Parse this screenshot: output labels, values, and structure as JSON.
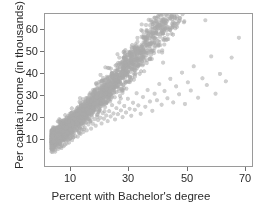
{
  "chart_data": {
    "type": "scatter",
    "title": "",
    "xlabel": "Percent with Bachelor's degree",
    "ylabel": "Per capita income (in thousands)",
    "xlim": [
      4,
      75
    ],
    "ylim": [
      6,
      67
    ],
    "xticks": [
      10,
      30,
      50,
      70
    ],
    "xticklabels": [
      "10",
      "30",
      "50",
      "70"
    ],
    "yticks": [
      10,
      20,
      30,
      40,
      50,
      60
    ],
    "yticklabels": [
      "10",
      "20",
      "30",
      "40",
      "50",
      "60"
    ],
    "grid": false,
    "legend": null,
    "marker_color": "#a9a9a9",
    "marker_size": 2.1,
    "marker_opacity": 0.55,
    "frame_color": "#9a9a9a",
    "n_points": 3100,
    "correlation": 0.73,
    "points": [
      [
        6.2,
        13.1
      ],
      [
        6.5,
        14.4
      ],
      [
        6.8,
        12.6
      ],
      [
        7.0,
        15.3
      ],
      [
        7.2,
        13.8
      ],
      [
        7.4,
        16.1
      ],
      [
        7.5,
        11.8
      ],
      [
        7.7,
        14.9
      ],
      [
        7.9,
        17.2
      ],
      [
        8.0,
        13.4
      ],
      [
        8.1,
        15.8
      ],
      [
        8.2,
        18.0
      ],
      [
        8.3,
        14.2
      ],
      [
        8.4,
        16.6
      ],
      [
        8.5,
        12.9
      ],
      [
        8.6,
        19.1
      ],
      [
        8.7,
        15.1
      ],
      [
        8.8,
        17.4
      ],
      [
        8.9,
        13.6
      ],
      [
        9.0,
        16.0
      ],
      [
        9.1,
        18.3
      ],
      [
        9.2,
        14.7
      ],
      [
        9.3,
        20.2
      ],
      [
        9.4,
        15.9
      ],
      [
        9.5,
        17.8
      ],
      [
        9.6,
        13.2
      ],
      [
        9.7,
        19.5
      ],
      [
        9.8,
        16.3
      ],
      [
        9.9,
        14.1
      ],
      [
        10.0,
        18.7
      ],
      [
        10.1,
        15.5
      ],
      [
        10.2,
        20.9
      ],
      [
        10.3,
        17.1
      ],
      [
        10.4,
        13.9
      ],
      [
        10.5,
        19.0
      ],
      [
        10.6,
        16.8
      ],
      [
        10.7,
        22.1
      ],
      [
        10.8,
        14.6
      ],
      [
        10.9,
        18.2
      ],
      [
        11.0,
        20.4
      ],
      [
        11.1,
        16.2
      ],
      [
        11.2,
        17.7
      ],
      [
        11.3,
        21.3
      ],
      [
        11.4,
        15.0
      ],
      [
        11.5,
        19.6
      ],
      [
        11.6,
        18.1
      ],
      [
        11.7,
        23.0
      ],
      [
        11.8,
        16.5
      ],
      [
        11.9,
        20.1
      ],
      [
        12.0,
        17.9
      ],
      [
        12.1,
        21.8
      ],
      [
        12.2,
        15.4
      ],
      [
        12.3,
        19.2
      ],
      [
        12.4,
        22.6
      ],
      [
        12.5,
        18.4
      ],
      [
        12.6,
        16.9
      ],
      [
        12.7,
        20.7
      ],
      [
        12.8,
        24.0
      ],
      [
        12.9,
        17.3
      ],
      [
        13.0,
        21.1
      ],
      [
        13.1,
        19.8
      ],
      [
        13.2,
        23.4
      ],
      [
        13.3,
        16.4
      ],
      [
        13.4,
        20.0
      ],
      [
        13.5,
        18.6
      ],
      [
        13.6,
        22.3
      ],
      [
        13.7,
        25.1
      ],
      [
        13.8,
        17.5
      ],
      [
        13.9,
        21.4
      ],
      [
        14.0,
        19.3
      ],
      [
        14.2,
        23.9
      ],
      [
        14.4,
        18.0
      ],
      [
        14.6,
        21.9
      ],
      [
        14.8,
        20.5
      ],
      [
        15.0,
        24.6
      ],
      [
        15.2,
        17.8
      ],
      [
        15.4,
        22.0
      ],
      [
        15.6,
        19.4
      ],
      [
        15.8,
        25.3
      ],
      [
        16.0,
        21.2
      ],
      [
        16.2,
        18.9
      ],
      [
        16.4,
        23.1
      ],
      [
        16.6,
        20.6
      ],
      [
        16.8,
        26.0
      ],
      [
        17.0,
        22.4
      ],
      [
        17.2,
        19.7
      ],
      [
        17.4,
        24.2
      ],
      [
        17.6,
        21.5
      ],
      [
        17.8,
        26.8
      ],
      [
        18.0,
        23.3
      ],
      [
        18.3,
        20.3
      ],
      [
        18.6,
        25.0
      ],
      [
        18.9,
        22.7
      ],
      [
        19.2,
        27.4
      ],
      [
        19.5,
        24.1
      ],
      [
        19.8,
        21.0
      ],
      [
        20.1,
        25.7
      ],
      [
        20.4,
        23.0
      ],
      [
        20.7,
        28.1
      ],
      [
        21.0,
        24.8
      ],
      [
        21.4,
        22.2
      ],
      [
        21.8,
        26.5
      ],
      [
        22.2,
        24.4
      ],
      [
        22.6,
        28.9
      ],
      [
        23.0,
        25.4
      ],
      [
        23.4,
        23.1
      ],
      [
        23.8,
        27.2
      ],
      [
        24.2,
        25.0
      ],
      [
        24.6,
        29.6
      ],
      [
        25.0,
        26.3
      ],
      [
        25.5,
        24.0
      ],
      [
        26.0,
        28.0
      ],
      [
        26.5,
        25.9
      ],
      [
        27.0,
        30.4
      ],
      [
        27.5,
        27.1
      ],
      [
        28.0,
        24.7
      ],
      [
        28.5,
        29.2
      ],
      [
        29.0,
        26.8
      ],
      [
        29.5,
        31.5
      ],
      [
        30.0,
        28.3
      ],
      [
        30.6,
        25.6
      ],
      [
        31.2,
        30.1
      ],
      [
        31.8,
        27.5
      ],
      [
        32.4,
        33.0
      ],
      [
        33.0,
        29.0
      ],
      [
        33.6,
        26.2
      ],
      [
        34.2,
        31.4
      ],
      [
        34.8,
        28.6
      ],
      [
        35.4,
        35.2
      ],
      [
        36.0,
        30.3
      ],
      [
        36.8,
        27.0
      ],
      [
        37.6,
        33.7
      ],
      [
        38.4,
        29.8
      ],
      [
        39.2,
        36.5
      ],
      [
        40.0,
        31.9
      ],
      [
        40.8,
        28.2
      ],
      [
        41.6,
        35.0
      ],
      [
        42.4,
        32.4
      ],
      [
        43.2,
        38.9
      ],
      [
        44.0,
        30.6
      ],
      [
        45.0,
        36.1
      ],
      [
        46.0,
        33.2
      ],
      [
        47.0,
        41.0
      ],
      [
        48.0,
        31.5
      ],
      [
        49.0,
        38.0
      ],
      [
        50.0,
        34.8
      ],
      [
        51.0,
        43.5
      ],
      [
        52.0,
        30.9
      ],
      [
        53.0,
        39.6
      ],
      [
        54.0,
        36.3
      ],
      [
        55.0,
        46.0
      ],
      [
        56.5,
        33.4
      ],
      [
        58.0,
        41.2
      ],
      [
        59.5,
        38.5
      ],
      [
        61.0,
        50.0
      ],
      [
        62.5,
        35.0
      ],
      [
        64.0,
        43.0
      ],
      [
        66.0,
        40.0
      ],
      [
        68.0,
        49.5
      ],
      [
        70.5,
        57.5
      ],
      [
        59.0,
        64.5
      ],
      [
        44.5,
        47.5
      ],
      [
        38.0,
        44.0
      ],
      [
        33.5,
        40.5
      ],
      [
        29.0,
        38.0
      ],
      [
        26.0,
        35.5
      ],
      [
        23.0,
        33.0
      ],
      [
        20.0,
        31.0
      ],
      [
        17.0,
        29.0
      ],
      [
        14.5,
        27.0
      ]
    ]
  }
}
